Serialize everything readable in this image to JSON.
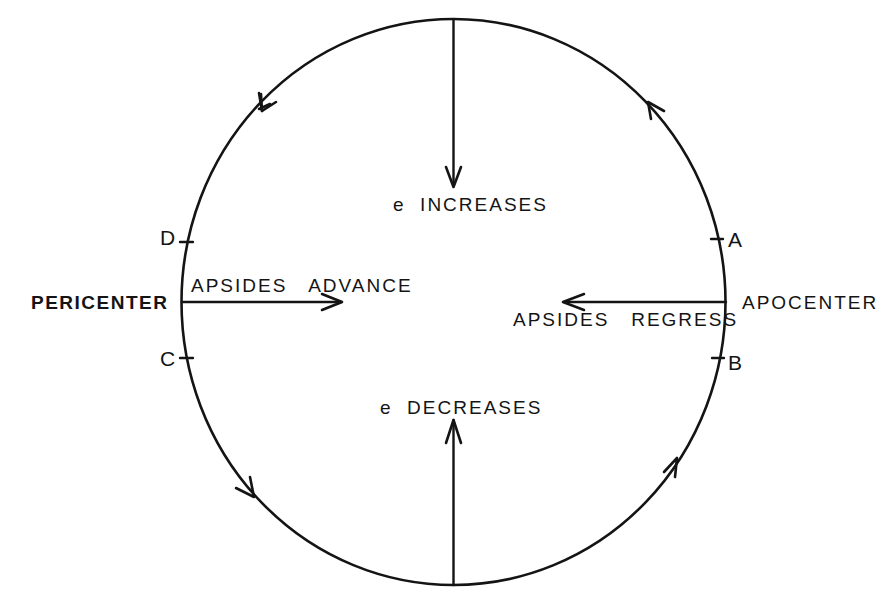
{
  "diagram": {
    "type": "orbit-perturbation-diagram",
    "stroke_color": "#141414",
    "background_color": "#ffffff",
    "orbit": {
      "shape": "ellipse",
      "direction": "counterclockwise",
      "arrow_count": 4
    },
    "labels": {
      "pericenter": "PERICENTER",
      "apocenter": "APOCENTER",
      "e_increases": "e  INCREASES",
      "e_decreases": "e  DECREASES",
      "apsides_advance": "APSIDES   ADVANCE",
      "apsides_regress": "APSIDES   REGRESS"
    },
    "points": [
      {
        "id": "A",
        "label": "A",
        "position": "upper-right, near apocenter"
      },
      {
        "id": "B",
        "label": "B",
        "position": "lower-right, near apocenter"
      },
      {
        "id": "C",
        "label": "C",
        "position": "lower-left, near pericenter"
      },
      {
        "id": "D",
        "label": "D",
        "position": "upper-left, near pericenter"
      }
    ],
    "vectors": [
      {
        "name": "e-increases-arrow",
        "from": "top of orbit",
        "direction": "down",
        "meaning": "e increases"
      },
      {
        "name": "e-decreases-arrow",
        "from": "bottom of orbit",
        "direction": "up",
        "meaning": "e decreases"
      },
      {
        "name": "apsides-advance-arrow",
        "from": "pericenter",
        "direction": "right",
        "meaning": "apsides advance"
      },
      {
        "name": "apsides-regress-arrow",
        "from": "apocenter",
        "direction": "left",
        "meaning": "apsides regress"
      }
    ]
  }
}
